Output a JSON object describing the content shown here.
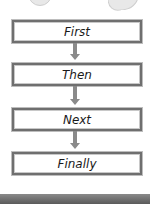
{
  "flowchart": {
    "steps": [
      {
        "label": "First"
      },
      {
        "label": "Then"
      },
      {
        "label": "Next"
      },
      {
        "label": "Finally"
      }
    ],
    "connector": "down-arrow"
  },
  "colors": {
    "box_border": "#6f6f6f",
    "arrow": "#8a8a8a",
    "text": "#1a1a1a",
    "background": "#ffffff"
  }
}
